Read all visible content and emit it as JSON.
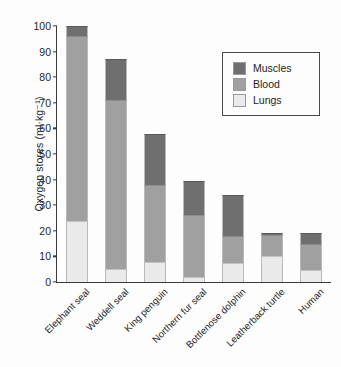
{
  "chart_data": {
    "type": "bar",
    "subtype": "stacked-vertical",
    "title": "",
    "xlabel": "",
    "ylabel": "Oxygen stores (ml·kg⁻¹)",
    "ylim": [
      0,
      100
    ],
    "ytick_values": [
      0,
      10,
      20,
      30,
      40,
      50,
      60,
      70,
      80,
      90,
      100
    ],
    "ytick_labels": [
      "0",
      "10",
      "20",
      "30",
      "40",
      "50",
      "60",
      "70",
      "80",
      "90",
      "100"
    ],
    "grid": false,
    "legend_position": "upper-right-inside",
    "categories": [
      "Elephant seal",
      "Weddell seal",
      "King penguin",
      "Northern fur seal",
      "Bottlenose dolphin",
      "Leatherback turtle",
      "Human"
    ],
    "series": [
      {
        "name": "Lungs",
        "color": "#eaeaea",
        "values": [
          24,
          5,
          8,
          2,
          7.5,
          10,
          4.5
        ]
      },
      {
        "name": "Blood",
        "color": "#a0a0a0",
        "values": [
          72,
          66,
          30,
          24,
          10.5,
          8.5,
          10.5
        ]
      },
      {
        "name": "Muscles",
        "color": "#6f6f6f",
        "values": [
          4,
          16,
          20,
          13.5,
          16,
          0.5,
          4
        ]
      }
    ],
    "totals": [
      100,
      87,
      58,
      39.5,
      34,
      19,
      19
    ],
    "annotations": []
  },
  "legend": {
    "items": [
      {
        "label": "Muscles",
        "color": "#6f6f6f"
      },
      {
        "label": "Blood",
        "color": "#a0a0a0"
      },
      {
        "label": "Lungs",
        "color": "#eaeaea"
      }
    ]
  }
}
